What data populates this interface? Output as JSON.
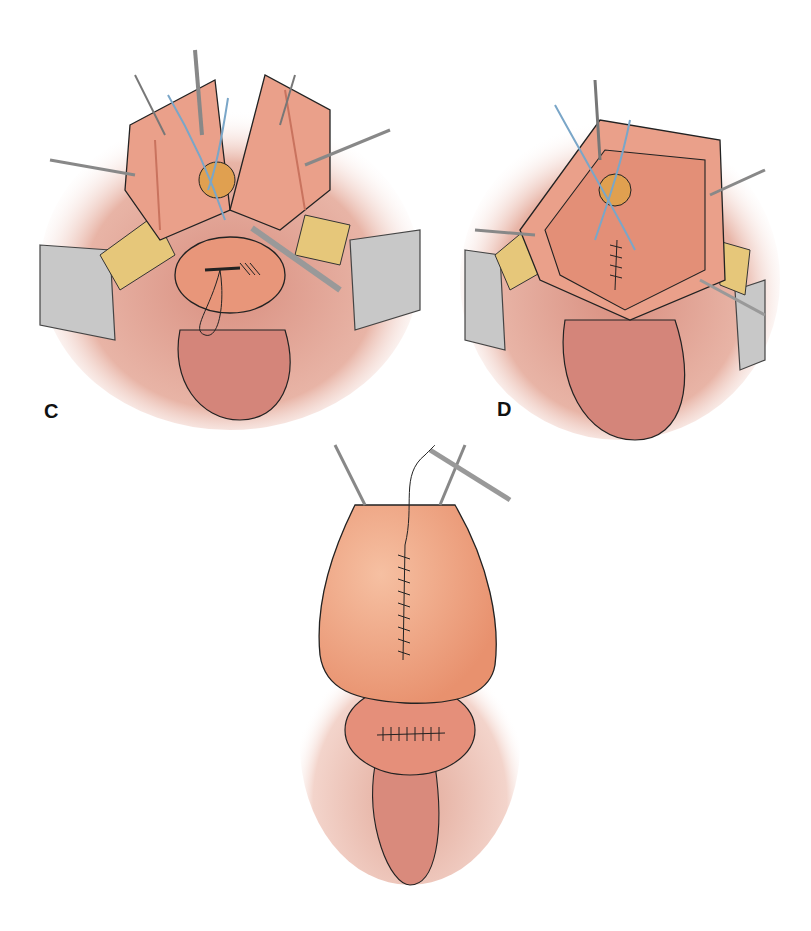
{
  "figure": {
    "panels": [
      {
        "id": "C",
        "label": "C"
      },
      {
        "id": "D",
        "label": "D"
      },
      {
        "id": "E",
        "label": ""
      }
    ]
  },
  "colors": {
    "tissue": "#e8967a",
    "tissue_light": "#f0b096",
    "tissue_dark": "#c9735e",
    "fat": "#e6c77a",
    "retractor": "#b8b8b8",
    "suture_blue": "#7aa6c8",
    "outline": "#222222",
    "bladder": "#efa47f",
    "balloon": "#e0a050"
  }
}
